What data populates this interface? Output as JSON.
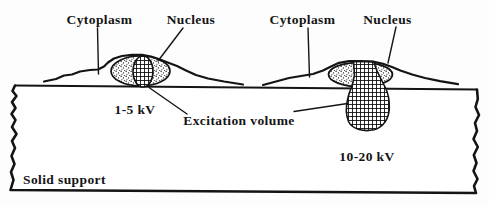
{
  "figure": {
    "colors": {
      "ink": "#141414",
      "background": "#fdfdfd",
      "fill": "#ffffff"
    },
    "cells": {
      "left": {
        "cytoplasm_label": "Cytoplasm",
        "nucleus_label": "Nucleus",
        "voltage_label": "1-5 kV"
      },
      "right": {
        "cytoplasm_label": "Cytoplasm",
        "nucleus_label": "Nucleus",
        "voltage_label": "10-20 kV"
      }
    },
    "excitation_label": "Excitation volume",
    "support_label": "Solid support"
  }
}
